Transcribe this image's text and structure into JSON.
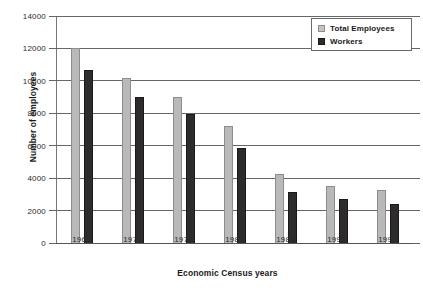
{
  "chart_data": {
    "type": "bar",
    "title": "",
    "xlabel": "Economic Census years",
    "ylabel": "Number of employees",
    "categories": [
      "1967",
      "1972",
      "1977",
      "1982",
      "1987",
      "1992",
      "1997"
    ],
    "series": [
      {
        "name": "Total Employees",
        "color": "#b9b9b9",
        "values": [
          12000,
          10150,
          9000,
          7200,
          4250,
          3500,
          3270
        ]
      },
      {
        "name": "Workers",
        "color": "#2e2b2b",
        "values": [
          10650,
          8980,
          7980,
          5830,
          3150,
          2740,
          2430
        ]
      }
    ],
    "ylim": [
      0,
      14000
    ],
    "ytick_labels": [
      "0",
      "2000",
      "4000",
      "6000",
      "8000",
      "10000",
      "12000",
      "14000"
    ],
    "ytick_values": [
      0,
      2000,
      4000,
      6000,
      8000,
      10000,
      12000,
      14000
    ],
    "grid": true,
    "legend_position": "top-right",
    "legend_entries": [
      "Total Employees",
      "Workers"
    ]
  }
}
